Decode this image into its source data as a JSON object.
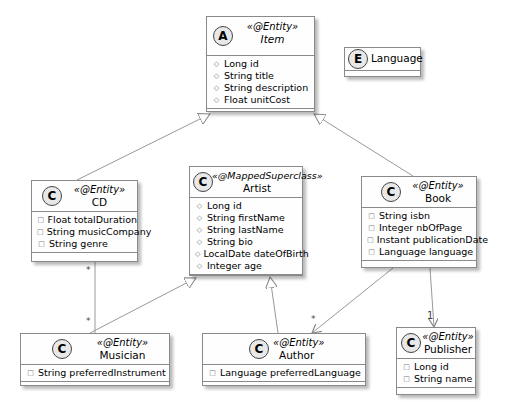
{
  "diagram": {
    "type": "UML class diagram",
    "classes": [
      {
        "id": "item",
        "badge": "A",
        "stereotype": "«@Entity»",
        "name": "Item",
        "abstract": true,
        "attributes": [
          {
            "marker": "◇",
            "text": "Long id"
          },
          {
            "marker": "◇",
            "text": "String title"
          },
          {
            "marker": "◇",
            "text": "String description"
          },
          {
            "marker": "◇",
            "text": "Float unitCost"
          }
        ]
      },
      {
        "id": "language",
        "badge": "E",
        "stereotype": "",
        "name": "Language",
        "attributes": []
      },
      {
        "id": "cd",
        "badge": "C",
        "stereotype": "«@Entity»",
        "name": "CD",
        "attributes": [
          {
            "marker": "□",
            "text": "Float totalDuration"
          },
          {
            "marker": "□",
            "text": "String musicCompany"
          },
          {
            "marker": "□",
            "text": "String genre"
          }
        ]
      },
      {
        "id": "artist",
        "badge": "C",
        "stereotype": "«@MappedSuperclass»",
        "name": "Artist",
        "attributes": [
          {
            "marker": "◇",
            "text": "Long id"
          },
          {
            "marker": "◇",
            "text": "String firstName"
          },
          {
            "marker": "◇",
            "text": "String lastName"
          },
          {
            "marker": "◇",
            "text": "String bio"
          },
          {
            "marker": "◇",
            "text": "LocalDate dateOfBirth"
          },
          {
            "marker": "◇",
            "text": "Integer age"
          }
        ]
      },
      {
        "id": "book",
        "badge": "C",
        "stereotype": "«@Entity»",
        "name": "Book",
        "attributes": [
          {
            "marker": "□",
            "text": "String isbn"
          },
          {
            "marker": "□",
            "text": "Integer nbOfPage"
          },
          {
            "marker": "□",
            "text": "Instant publicationDate"
          },
          {
            "marker": "□",
            "text": "Language language"
          }
        ]
      },
      {
        "id": "musician",
        "badge": "C",
        "stereotype": "«@Entity»",
        "name": "Musician",
        "attributes": [
          {
            "marker": "□",
            "text": "String preferredInstrument"
          }
        ]
      },
      {
        "id": "author",
        "badge": "C",
        "stereotype": "«@Entity»",
        "name": "Author",
        "attributes": [
          {
            "marker": "□",
            "text": "Language preferredLanguage"
          }
        ]
      },
      {
        "id": "publisher",
        "badge": "C",
        "stereotype": "«@Entity»",
        "name": "Publisher",
        "attributes": [
          {
            "marker": "□",
            "text": "Long id"
          },
          {
            "marker": "□",
            "text": "String name"
          }
        ]
      }
    ],
    "relations": [
      {
        "from": "CD",
        "to": "Item",
        "kind": "generalization"
      },
      {
        "from": "Book",
        "to": "Item",
        "kind": "generalization"
      },
      {
        "from": "Musician",
        "to": "Artist",
        "kind": "generalization"
      },
      {
        "from": "Author",
        "to": "Artist",
        "kind": "generalization"
      },
      {
        "from": "CD",
        "to": "Musician",
        "kind": "association",
        "from_mult": "*",
        "to_mult": "*"
      },
      {
        "from": "Book",
        "to": "Author",
        "kind": "directed-association",
        "to_mult": "*"
      },
      {
        "from": "Book",
        "to": "Publisher",
        "kind": "directed-association",
        "to_mult": "1"
      }
    ],
    "multiplicities": {
      "cd_musician_top": "*",
      "cd_musician_bottom": "*",
      "book_author": "*",
      "book_publisher": "1"
    }
  }
}
